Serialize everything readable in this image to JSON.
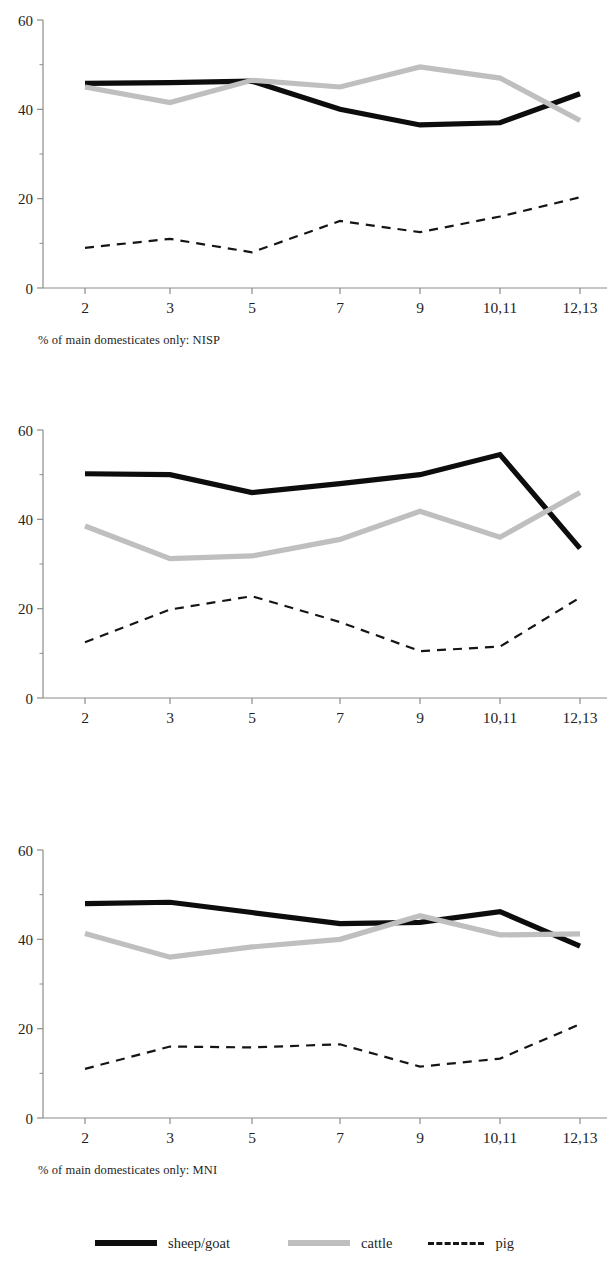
{
  "figure": {
    "colors": {
      "sheep_goat": "#0d0d0d",
      "cattle": "#bfbfbf",
      "pig": "#151515",
      "axis": "#8c8c8c",
      "text": "#232323",
      "background": "#ffffff"
    }
  },
  "legend": {
    "items": [
      {
        "label": "sheep/goat",
        "style": "solid-black",
        "swatch_name": "legend-swatch-sheep-goat"
      },
      {
        "label": "cattle",
        "style": "solid-gray",
        "swatch_name": "legend-swatch-cattle"
      },
      {
        "label": "pig",
        "style": "dashed-black",
        "swatch_name": "legend-swatch-pig"
      }
    ]
  },
  "chart_data": [
    {
      "type": "line",
      "title": "% of main domesticates only: NISP",
      "caption": "% of main domesticates only: NISP",
      "xlabel": "",
      "ylabel": "",
      "categories": [
        "2",
        "3",
        "5",
        "7",
        "9",
        "10,11",
        "12,13"
      ],
      "yticks": [
        0,
        20,
        40,
        60
      ],
      "ylim": [
        0,
        60
      ],
      "grid": false,
      "legend_position": "bottom",
      "series": [
        {
          "name": "sheep/goat",
          "style": "solid",
          "color": "#0d0d0d",
          "values": [
            45.8,
            46.0,
            46.3,
            40.0,
            36.5,
            37.0,
            43.5
          ]
        },
        {
          "name": "cattle",
          "style": "solid",
          "color": "#bfbfbf",
          "values": [
            45.0,
            41.5,
            46.5,
            45.0,
            49.5,
            47.0,
            37.5
          ]
        },
        {
          "name": "pig",
          "style": "dashed",
          "color": "#151515",
          "values": [
            9.0,
            11.0,
            8.0,
            15.0,
            12.5,
            16.0,
            20.3
          ]
        }
      ]
    },
    {
      "type": "line",
      "title": "% of main domesticates only: MNI",
      "caption": "% of main domesticates only: MNI",
      "xlabel": "",
      "ylabel": "",
      "categories": [
        "2",
        "3",
        "5",
        "7",
        "9",
        "10,11",
        "12,13"
      ],
      "yticks": [
        0,
        20,
        40,
        60
      ],
      "ylim": [
        0,
        60
      ],
      "grid": false,
      "legend_position": "bottom",
      "series": [
        {
          "name": "sheep/goat",
          "style": "solid",
          "color": "#0d0d0d",
          "values": [
            50.2,
            50.0,
            46.0,
            48.0,
            50.0,
            54.5,
            33.5
          ]
        },
        {
          "name": "cattle",
          "style": "solid",
          "color": "#bfbfbf",
          "values": [
            38.5,
            31.2,
            31.8,
            35.5,
            41.8,
            36.0,
            46.0
          ]
        },
        {
          "name": "pig",
          "style": "dashed",
          "color": "#151515",
          "values": [
            12.5,
            19.8,
            22.8,
            17.0,
            10.5,
            11.5,
            22.5
          ]
        }
      ]
    },
    {
      "type": "line",
      "title": "Mean of MNI & NISP for main domesticates",
      "caption": "Mean of MNI & NISP for main domesticates",
      "xlabel": "",
      "ylabel": "",
      "categories": [
        "2",
        "3",
        "5",
        "7",
        "9",
        "10,11",
        "12,13"
      ],
      "yticks": [
        0,
        20,
        40,
        60
      ],
      "ylim": [
        0,
        60
      ],
      "grid": false,
      "legend_position": "bottom",
      "series": [
        {
          "name": "sheep/goat",
          "style": "solid",
          "color": "#0d0d0d",
          "values": [
            48.0,
            48.3,
            46.0,
            43.5,
            43.8,
            46.2,
            38.5
          ]
        },
        {
          "name": "cattle",
          "style": "solid",
          "color": "#bfbfbf",
          "values": [
            41.3,
            36.0,
            38.3,
            40.0,
            45.3,
            41.0,
            41.2
          ]
        },
        {
          "name": "pig",
          "style": "dashed",
          "color": "#151515",
          "values": [
            11.0,
            16.0,
            15.8,
            16.5,
            11.5,
            13.3,
            21.0
          ]
        }
      ]
    }
  ]
}
